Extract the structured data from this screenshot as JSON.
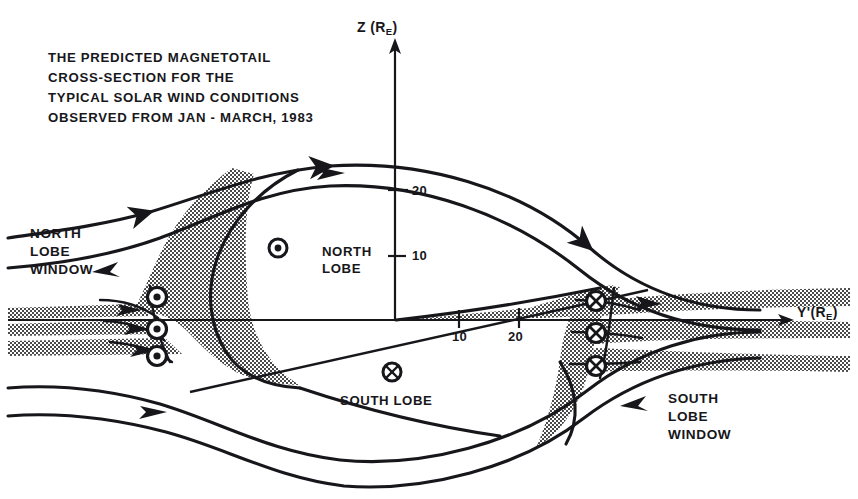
{
  "figure": {
    "title_lines": [
      "THE PREDICTED MAGNETOTAIL",
      "CROSS-SECTION FOR THE",
      "TYPICAL SOLAR WIND CONDITIONS",
      "OBSERVED FROM JAN - MARCH, 1983"
    ],
    "title_text": "THE PREDICTED MAGNETOTAIL\nCROSS-SECTION FOR THE\nTYPICAL SOLAR WIND CONDITIONS\nOBSERVED FROM JAN - MARCH, 1983",
    "ink_color": "#17171b",
    "background_color": "#ffffff",
    "hatch_color": "#4a4a4a"
  },
  "axes": {
    "vertical": {
      "label_main": "Z",
      "label_unit": "(R",
      "label_sub": "E",
      "label_close": ")",
      "label_full": "Z (R_E)",
      "ticks": [
        "20",
        "10"
      ],
      "tick_values": [
        20,
        10
      ]
    },
    "horizontal": {
      "label_main": "Y'",
      "label_unit": "(R",
      "label_sub": "E",
      "label_close": ")",
      "label_full": "Y' (R_E)",
      "ticks": [
        "10",
        "20"
      ],
      "tick_values": [
        10,
        20
      ]
    }
  },
  "labels": {
    "north_lobe_window": "NORTH\nLOBE\nWINDOW",
    "south_lobe_window": "SOUTH\nLOBE\nWINDOW",
    "north_lobe": "NORTH\nLOBE",
    "south_lobe": "SOUTH LOBE"
  },
  "field_symbols": {
    "out_of_page_glyph": "circle-dot",
    "into_page_glyph": "circle-cross",
    "north_lobe_center": {
      "glyph": "circle-dot",
      "x": 278,
      "y": 248
    },
    "south_lobe_center": {
      "glyph": "circle-cross",
      "x": 392,
      "y": 372
    },
    "left_window_column": [
      {
        "glyph": "circle-dot",
        "x": 157,
        "y": 297
      },
      {
        "glyph": "circle-dot",
        "x": 157,
        "y": 329
      },
      {
        "glyph": "circle-dot",
        "x": 157,
        "y": 356
      }
    ],
    "right_window_column": [
      {
        "glyph": "circle-cross",
        "x": 596,
        "y": 301
      },
      {
        "glyph": "circle-cross",
        "x": 596,
        "y": 333
      },
      {
        "glyph": "circle-cross",
        "x": 596,
        "y": 366
      }
    ]
  },
  "origin": {
    "x": 395,
    "y": 320
  }
}
